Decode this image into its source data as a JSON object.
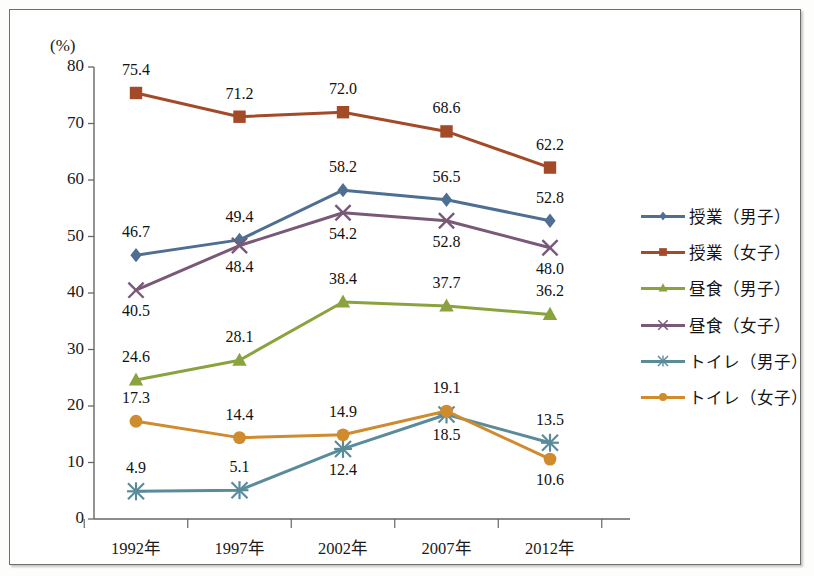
{
  "chart_data": {
    "type": "line",
    "title": "",
    "subtitle": "",
    "xlabel": "",
    "ylabel": "(%)",
    "unit_label": "(%)",
    "categories": [
      "1992年",
      "1997年",
      "2002年",
      "2007年",
      "2012年"
    ],
    "ylim": [
      0,
      80
    ],
    "ytick_step": 10,
    "yticks": [
      0,
      10,
      20,
      30,
      40,
      50,
      60,
      70,
      80
    ],
    "grid": false,
    "legend_position": "right",
    "data_labels": true,
    "series": [
      {
        "name": "授業（男子）",
        "color": "#4e6f93",
        "marker": "diamond",
        "values": [
          46.7,
          49.4,
          58.2,
          56.5,
          52.8
        ],
        "label_text": [
          "46.7",
          "49.4",
          "58.2",
          "56.5",
          "52.8"
        ],
        "label_pos": [
          "above",
          "above",
          "above",
          "above",
          "above"
        ]
      },
      {
        "name": "授業（女子）",
        "color": "#a34a28",
        "marker": "square",
        "values": [
          75.4,
          71.2,
          72.0,
          68.6,
          62.2
        ],
        "label_text": [
          "75.4",
          "71.2",
          "72.0",
          "68.6",
          "62.2"
        ],
        "label_pos": [
          "above",
          "above",
          "above",
          "above",
          "above"
        ]
      },
      {
        "name": "昼食（男子）",
        "color": "#8aa33f",
        "marker": "triangle",
        "values": [
          24.6,
          28.1,
          38.4,
          37.7,
          36.2
        ],
        "label_text": [
          "24.6",
          "28.1",
          "38.4",
          "37.7",
          "36.2"
        ],
        "label_pos": [
          "above",
          "above",
          "above",
          "above",
          "above"
        ]
      },
      {
        "name": "昼食（女子）",
        "color": "#7a5878",
        "marker": "cross",
        "values": [
          40.5,
          48.4,
          54.2,
          52.8,
          48.0
        ],
        "label_text": [
          "40.5",
          "48.4",
          "54.2",
          "52.8",
          "48.0"
        ],
        "label_pos": [
          "below",
          "below",
          "below",
          "below",
          "below"
        ]
      },
      {
        "name": "トイレ（男子）",
        "color": "#5a8b9b",
        "marker": "asterisk",
        "values": [
          4.9,
          5.1,
          12.4,
          18.5,
          13.5
        ],
        "label_text": [
          "4.9",
          "5.1",
          "12.4",
          "18.5",
          "13.5"
        ],
        "label_pos": [
          "above",
          "above",
          "below",
          "below",
          "above"
        ]
      },
      {
        "name": "トイレ（女子）",
        "color": "#cf8b2e",
        "marker": "circle",
        "values": [
          17.3,
          14.4,
          14.9,
          19.1,
          10.6
        ],
        "label_text": [
          "17.3",
          "14.4",
          "14.9",
          "19.1",
          "10.6"
        ],
        "label_pos": [
          "above",
          "above",
          "above",
          "above",
          "below"
        ]
      }
    ]
  },
  "legend": {
    "items": [
      {
        "label": "授業（男子）",
        "color": "#4e6f93",
        "marker": "diamond"
      },
      {
        "label": "授業（女子）",
        "color": "#a34a28",
        "marker": "square"
      },
      {
        "label": "昼食（男子）",
        "color": "#8aa33f",
        "marker": "triangle"
      },
      {
        "label": "昼食（女子）",
        "color": "#7a5878",
        "marker": "cross"
      },
      {
        "label": "トイレ（男子）",
        "color": "#5a8b9b",
        "marker": "asterisk"
      },
      {
        "label": "トイレ（女子）",
        "color": "#cf8b2e",
        "marker": "circle"
      }
    ]
  },
  "axes": {
    "y_labels": [
      "80",
      "70",
      "60",
      "50",
      "40",
      "30",
      "20",
      "10",
      "0"
    ],
    "x_labels": [
      "1992年",
      "1997年",
      "2002年",
      "2007年",
      "2012年"
    ],
    "unit": "(%)"
  },
  "style": {
    "axis_color": "#666666",
    "frame_color": "#6e6e6e",
    "background": "#ffffff",
    "text_color": "#111111"
  }
}
